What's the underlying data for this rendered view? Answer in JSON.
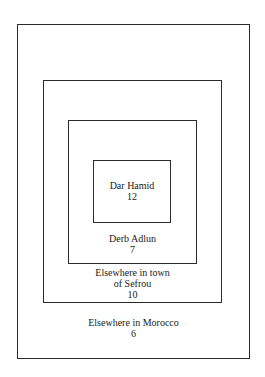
{
  "diagram": {
    "type": "nested-boxes",
    "levels": [
      {
        "name": "Dar Hamid",
        "count": "12"
      },
      {
        "name": "Derb Adlun",
        "count": "7"
      },
      {
        "name_line1": "Elsewhere in town",
        "name_line2": "of Sefrou",
        "count": "10"
      },
      {
        "name": "Elsewhere in Morocco",
        "count": "6"
      }
    ]
  }
}
